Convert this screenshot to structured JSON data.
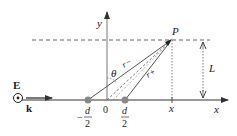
{
  "diagram": {
    "labels": {
      "y_axis": "y",
      "x_axis": "x",
      "origin": "0",
      "point": "P",
      "angle": "θ",
      "r_minus": "r−",
      "r_plus": "r+",
      "distance": "L",
      "x_tick": "x",
      "field": "E",
      "wavevector": "k",
      "left_source_num": "d",
      "left_source_sign": "−",
      "left_source_den": "2",
      "right_source_num": "d",
      "right_source_den": "2"
    },
    "colors": {
      "axis": "#666666",
      "line": "#444444",
      "source_dot": "#888888",
      "dashed": "#555555"
    }
  }
}
